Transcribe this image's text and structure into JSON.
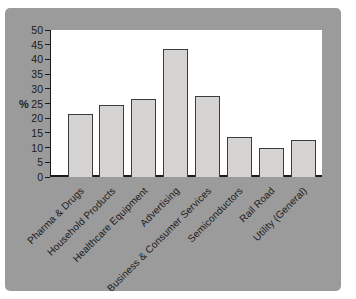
{
  "chart_data": {
    "type": "bar",
    "title": "",
    "xlabel": "",
    "ylabel": "%",
    "categories": [
      "Pharma & Drugs",
      "Household Products",
      "Healthcare Equipment",
      "Advertising",
      "Business & Consumer Services",
      "Semiconductors",
      "Rail Road",
      "Utility (General)"
    ],
    "values": [
      21.5,
      24.5,
      26.5,
      43.5,
      27.5,
      13.5,
      10,
      12.5
    ],
    "ylim": [
      0,
      50
    ],
    "ytick_step": 5,
    "grid": false,
    "legend": "none",
    "colors": {
      "panel_bg": "#9b9b9b",
      "plot_bg": "#ffffff",
      "bar_fill": "#d5d4d2",
      "bar_border": "#3c3c3c",
      "axis": "#1a1a1a",
      "text": "#1c1c1c"
    }
  }
}
